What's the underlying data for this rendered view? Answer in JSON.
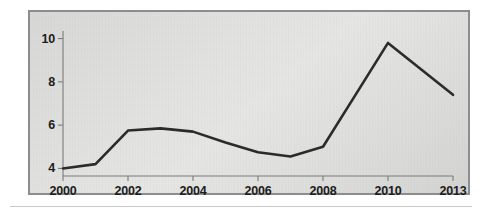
{
  "figure": {
    "panel_bg": "#e0e0de",
    "panel_border": "#8d8d8d",
    "line_color": "#2b2b2b",
    "axis_color": "#7a7a78",
    "text_color": "#1c1c1c",
    "rule_color": "#c9c9c7"
  },
  "chart_data": {
    "type": "line",
    "title": "",
    "subtitle": "",
    "xlabel": "",
    "ylabel": "",
    "x": [
      2000,
      2001,
      2002,
      2003,
      2004,
      2005,
      2006,
      2007,
      2008,
      2009,
      2010,
      2011,
      2012,
      2013
    ],
    "values": [
      4.0,
      4.2,
      5.75,
      5.85,
      5.7,
      5.2,
      4.75,
      4.55,
      5.0,
      7.4,
      9.8,
      9.0,
      8.2,
      7.4
    ],
    "series": [
      {
        "name": "",
        "values": [
          4.0,
          4.2,
          5.75,
          5.85,
          5.7,
          5.2,
          4.75,
          4.55,
          5.0,
          7.4,
          9.8,
          9.0,
          8.2,
          7.4
        ]
      }
    ],
    "xtick_values": [
      2000,
      2002,
      2004,
      2006,
      2008,
      2010,
      2013
    ],
    "xtick_labels": [
      "2000",
      "2002",
      "2004",
      "2006",
      "2008",
      "2010",
      "2013"
    ],
    "ytick_values": [
      4,
      6,
      8,
      10
    ],
    "ytick_labels": [
      "4",
      "6",
      "8",
      "10"
    ],
    "xlim": [
      2000,
      2013
    ],
    "ylim": [
      3.65,
      10.35
    ],
    "grid": false,
    "legend": "none",
    "markers": false,
    "line_width": 2.6
  },
  "axes": {
    "y_ticks": [
      {
        "label": "10"
      },
      {
        "label": "8"
      },
      {
        "label": "6"
      },
      {
        "label": "4"
      }
    ],
    "x_ticks": [
      {
        "label": "2000"
      },
      {
        "label": "2002"
      },
      {
        "label": "2004"
      },
      {
        "label": "2006"
      },
      {
        "label": "2008"
      },
      {
        "label": "2010"
      },
      {
        "label": "2013"
      }
    ]
  }
}
